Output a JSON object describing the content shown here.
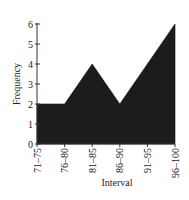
{
  "chart_data": {
    "type": "area",
    "title": "",
    "xlabel": "Interval",
    "ylabel": "Frequency",
    "categories": [
      "71–75",
      "76–80",
      "81–85",
      "86–90",
      "91–95",
      "96–100"
    ],
    "values": [
      2,
      2,
      4,
      2,
      4,
      6
    ],
    "ylim": [
      0,
      6
    ],
    "yticks": [
      0,
      1,
      2,
      3,
      4,
      5,
      6
    ],
    "grid": false,
    "legend": null,
    "fill_color": "#1c1c1c"
  }
}
